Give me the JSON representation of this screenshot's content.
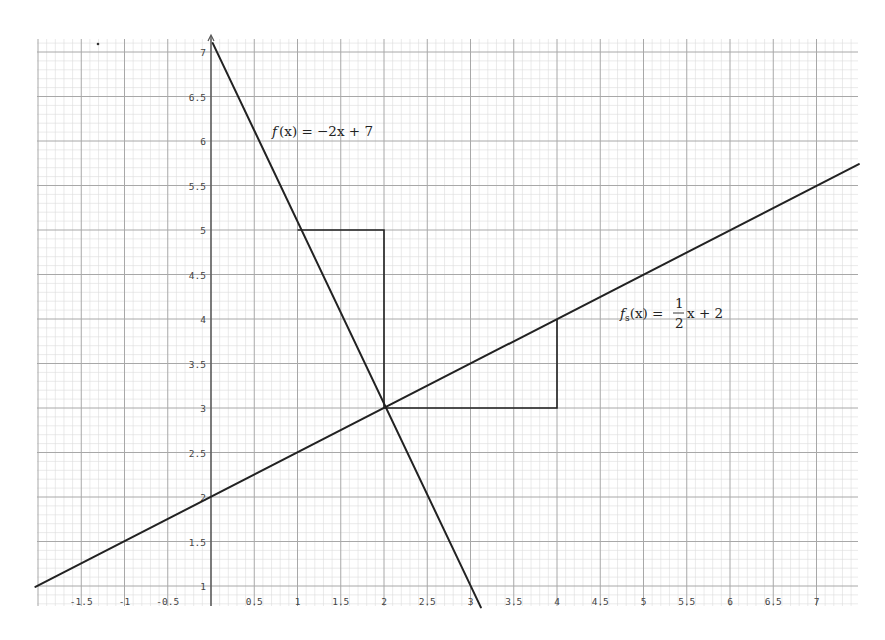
{
  "chart_data": {
    "type": "line",
    "title": "",
    "xlabel": "",
    "ylabel": "",
    "xlim": [
      -2,
      7.4
    ],
    "ylim": [
      0.72,
      7.15
    ],
    "grid": true,
    "minor_grid_step": 0.1,
    "major_grid_step": 0.5,
    "x_ticks": [
      -1.5,
      -1,
      -0.5,
      0.5,
      1,
      1.5,
      2,
      2.5,
      3,
      3.5,
      4,
      4.5,
      5,
      5.5,
      6,
      6.5,
      7
    ],
    "x_tick_labels": [
      "-1.5",
      "-1",
      "-0.5",
      "0.5",
      "1",
      "1.5",
      "2",
      "2.5",
      "3",
      "3.5",
      "4",
      "4.5",
      "5",
      "5.5",
      "6",
      "6.5",
      "7"
    ],
    "y_ticks": [
      1,
      1.5,
      2,
      2.5,
      3,
      3.5,
      4,
      4.5,
      5,
      5.5,
      6,
      6.5,
      7
    ],
    "y_tick_labels": [
      "1",
      "1.5",
      "2",
      "2.5",
      "3",
      "3.5",
      "4",
      "4.5",
      "5",
      "5.5",
      "6",
      "6.5",
      "7"
    ],
    "series": [
      {
        "name": "f(x) = -2x + 7",
        "slope": -2,
        "intercept": 7,
        "x": [
          0.02,
          3.12
        ],
        "y": [
          7.1,
          0.76
        ]
      },
      {
        "name": "f_s(x) = 1/2 x + 2",
        "slope": 0.5,
        "intercept": 2,
        "x": [
          -2.03,
          7.49
        ],
        "y": [
          0.99,
          5.74
        ]
      }
    ],
    "slope_triangles": [
      {
        "for": "f(x)",
        "points": [
          [
            1,
            5
          ],
          [
            2,
            5
          ],
          [
            2,
            3
          ]
        ]
      },
      {
        "for": "f_s(x)",
        "points": [
          [
            2,
            3
          ],
          [
            4,
            3
          ],
          [
            4,
            4
          ]
        ]
      }
    ],
    "intersection": {
      "x": 2,
      "y": 3
    },
    "annotations": [
      {
        "text": "f(x) = −2x + 7",
        "x": 0.7,
        "y": 6.1
      },
      {
        "text": "f_s(x) = ½x + 2",
        "x": 4.7,
        "y": 4.05
      }
    ]
  },
  "labels": {
    "f_name": "f",
    "f_arg": "(x)",
    "f_rhs": " = −2x + 7",
    "g_name": "f",
    "g_sub": "s",
    "g_arg": "(x)",
    "g_eq": " = ",
    "g_num": "1",
    "g_den": "2",
    "g_tail": "x + 2"
  },
  "colors": {
    "line": "#222222",
    "major_grid": "#a8a8a8",
    "minor_grid": "#dcdcdc",
    "axis": "#555555"
  }
}
